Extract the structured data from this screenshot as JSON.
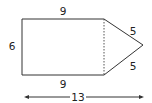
{
  "figure": {
    "type": "composite-shape",
    "colors": {
      "stroke": "#333333",
      "text": "#222222",
      "background": "#ffffff"
    }
  },
  "labels": {
    "top_side": "9",
    "bottom_side": "9",
    "left_side": "6",
    "triangle_upper_side": "5",
    "triangle_lower_side": "5",
    "total_length": "13"
  },
  "dimensions": {
    "rectangle_width": 9,
    "rectangle_height": 6,
    "triangle_side": 5,
    "total_length": 13
  }
}
